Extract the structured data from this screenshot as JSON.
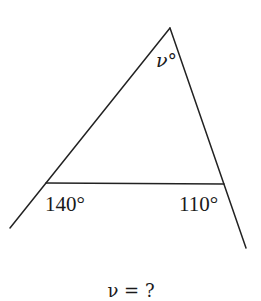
{
  "figure": {
    "type": "triangle-with-exterior-angles",
    "labels": {
      "apex_angle": "ν°",
      "left_exterior_angle": "140°",
      "right_exterior_angle": "110°"
    },
    "question": "ν = ?",
    "colors": {
      "stroke": "#222222",
      "text": "#1a1a1a",
      "background": "#ffffff"
    }
  }
}
